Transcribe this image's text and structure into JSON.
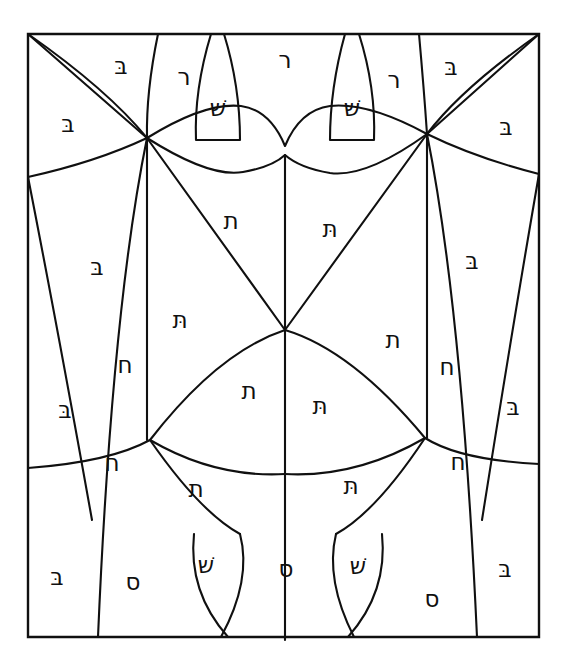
{
  "figure": {
    "background_color": "#ffffff",
    "line_color": "#101010",
    "frame": {
      "x": 28,
      "y": 34,
      "width": 511,
      "height": 603
    }
  },
  "letters": [
    {
      "id": "l01",
      "char": "בּ",
      "name": "bet-dagesh",
      "x": 121,
      "y": 67,
      "size": 23
    },
    {
      "id": "l02",
      "char": "ר",
      "name": "resh",
      "x": 184,
      "y": 78,
      "size": 23
    },
    {
      "id": "l03",
      "char": "ר",
      "name": "resh",
      "x": 285,
      "y": 61,
      "size": 23
    },
    {
      "id": "l04",
      "char": "ר",
      "name": "resh",
      "x": 394,
      "y": 81,
      "size": 23
    },
    {
      "id": "l05",
      "char": "בּ",
      "name": "bet-dagesh",
      "x": 451,
      "y": 68,
      "size": 23
    },
    {
      "id": "l06",
      "char": "שׁ",
      "name": "shin-dot",
      "x": 218,
      "y": 109,
      "size": 23
    },
    {
      "id": "l07",
      "char": "שׁ",
      "name": "shin-dot",
      "x": 352,
      "y": 109,
      "size": 23
    },
    {
      "id": "l08",
      "char": "בּ",
      "name": "bet-dagesh",
      "x": 68,
      "y": 125,
      "size": 23
    },
    {
      "id": "l09",
      "char": "בּ",
      "name": "bet-dagesh",
      "x": 506,
      "y": 128,
      "size": 23
    },
    {
      "id": "l10",
      "char": "ת",
      "name": "tav",
      "x": 231,
      "y": 222,
      "size": 23
    },
    {
      "id": "l11",
      "char": "תּ",
      "name": "tav-dagesh",
      "x": 330,
      "y": 230,
      "size": 23
    },
    {
      "id": "l12",
      "char": "בּ",
      "name": "bet-dagesh",
      "x": 97,
      "y": 268,
      "size": 23
    },
    {
      "id": "l13",
      "char": "בּ",
      "name": "bet-dagesh",
      "x": 472,
      "y": 262,
      "size": 23
    },
    {
      "id": "l14",
      "char": "תּ",
      "name": "tav-dagesh",
      "x": 180,
      "y": 321,
      "size": 23
    },
    {
      "id": "l15",
      "char": "ת",
      "name": "tav",
      "x": 393,
      "y": 341,
      "size": 23
    },
    {
      "id": "l16",
      "char": "ח",
      "name": "chet",
      "x": 125,
      "y": 366,
      "size": 23
    },
    {
      "id": "l17",
      "char": "ח",
      "name": "chet",
      "x": 447,
      "y": 368,
      "size": 23
    },
    {
      "id": "l18",
      "char": "ת",
      "name": "tav",
      "x": 249,
      "y": 392,
      "size": 23
    },
    {
      "id": "l19",
      "char": "תּ",
      "name": "tav-dagesh",
      "x": 320,
      "y": 407,
      "size": 23
    },
    {
      "id": "l20",
      "char": "בּ",
      "name": "bet-dagesh",
      "x": 65,
      "y": 411,
      "size": 23
    },
    {
      "id": "l21",
      "char": "בּ",
      "name": "bet-dagesh",
      "x": 513,
      "y": 408,
      "size": 23
    },
    {
      "id": "l22",
      "char": "ח",
      "name": "chet",
      "x": 112,
      "y": 464,
      "size": 23
    },
    {
      "id": "l23",
      "char": "ח",
      "name": "chet",
      "x": 458,
      "y": 463,
      "size": 23
    },
    {
      "id": "l24",
      "char": "ת",
      "name": "tav",
      "x": 196,
      "y": 490,
      "size": 23
    },
    {
      "id": "l25",
      "char": "תּ",
      "name": "tav-dagesh",
      "x": 351,
      "y": 487,
      "size": 23
    },
    {
      "id": "l26",
      "char": "שׁ",
      "name": "shin-dot",
      "x": 206,
      "y": 566,
      "size": 23
    },
    {
      "id": "l27",
      "char": "שׁ",
      "name": "shin-dot",
      "x": 358,
      "y": 567,
      "size": 23
    },
    {
      "id": "l28",
      "char": "ס",
      "name": "samekh",
      "x": 133,
      "y": 583,
      "size": 23
    },
    {
      "id": "l29",
      "char": "ס",
      "name": "samekh",
      "x": 286,
      "y": 570,
      "size": 23
    },
    {
      "id": "l30",
      "char": "ס",
      "name": "samekh",
      "x": 432,
      "y": 600,
      "size": 23
    },
    {
      "id": "l31",
      "char": "בּ",
      "name": "bet-dagesh",
      "x": 57,
      "y": 578,
      "size": 23
    },
    {
      "id": "l32",
      "char": "בּ",
      "name": "bet-dagesh",
      "x": 505,
      "y": 570,
      "size": 23
    }
  ],
  "paths": {
    "frame": "M28,34 L539,34 L539,637 L28,637 Z",
    "diag_tl": "M28,34 L147,138",
    "diag_tr": "M539,34 L427,134",
    "arc_left_upper": "M28,34 Q108,90 147,138",
    "arc_right_upper": "M539,34 Q462,88 427,134",
    "arc_left_lower_out": "M28,177 Q96,162 147,138",
    "arc_right_lower_out": "M539,174 Q476,158 427,134",
    "rib_left_in": "M158,34 Q146,92 147,138",
    "rib_right_in": "M419,34 Q424,90 427,134",
    "shin_left_body": "M211,34 Q194,90 196,140 L240,140 Q240,86 224,34",
    "shin_right_body": "M345,34 Q330,88 330,140 L374,140 Q376,88 359,34",
    "scallop_upper": "M147,138 Q205,102 241,106 Q270,110 285,146 Q300,110 330,106 Q368,102 427,134",
    "scallop_lower": "M147,138 Q210,178 243,172 Q272,167 285,155 Q300,168 330,173 Q366,178 427,134",
    "vert_left": "M147,138 L147,440",
    "vert_right": "M427,134 L427,438",
    "vert_center": "M285,155 L285,640",
    "vshape_left": "M147,138 L285,330",
    "vshape_right": "M427,134 L285,330",
    "cup_left": "M285,330 Q218,352 150,440",
    "cup_right": "M285,330 Q352,350 425,438",
    "band_left": "M150,440 Q215,478 285,474",
    "band_right": "M425,438 Q356,478 285,474",
    "long_left_out": "M28,177 Q58,330 92,520",
    "long_right_out": "M539,174 Q512,330 482,520",
    "inner_left_long": "M147,138 Q112,310 98,637",
    "inner_right_long": "M427,134 Q462,310 477,637",
    "low_left_arc": "M28,468 Q110,462 150,440",
    "low_right_arc": "M539,464 Q460,460 425,438",
    "bowl_left": "M150,440 Q200,512 240,534",
    "bowl_right": "M425,438 Q376,512 336,534",
    "tail_shin_left": "M240,534 Q252,580 221,637",
    "tail_shin_left2": "M194,534 Q188,592 228,637",
    "tail_shin_right": "M336,534 Q325,580 354,637",
    "tail_shin_right2": "M382,534 Q388,592 348,637",
    "shin_low_left_top": "M194,534 L240,534",
    "shin_low_right_top": "M336,534 L382,534"
  }
}
